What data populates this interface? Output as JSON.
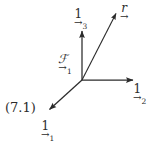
{
  "figure": {
    "kind": "vector-frame-diagram",
    "background_color": "#ffffff",
    "stroke_color": "#2b2b2b",
    "equation_number": "(7.1)",
    "origin": {
      "x": 82,
      "y": 80
    },
    "labels": {
      "unit_vector_1": {
        "symbol": "1",
        "subscript": "1",
        "arrow": "→"
      },
      "unit_vector_2": {
        "symbol": "1",
        "subscript": "2",
        "arrow": "→"
      },
      "unit_vector_3": {
        "symbol": "1",
        "subscript": "3",
        "arrow": "→"
      },
      "position_vector": {
        "symbol": "r",
        "subscript": "",
        "arrow": "→"
      },
      "frame": {
        "symbol": "ℱ",
        "subscript": "1",
        "arrow": "→"
      }
    },
    "vectors": [
      {
        "name": "unit-vector-1",
        "from": [
          82,
          80
        ],
        "to": [
          47,
          112
        ],
        "label": "1",
        "subscript": "1"
      },
      {
        "name": "unit-vector-2",
        "from": [
          82,
          80
        ],
        "to": [
          136,
          80
        ],
        "label": "1",
        "subscript": "2"
      },
      {
        "name": "unit-vector-3",
        "from": [
          82,
          80
        ],
        "to": [
          82,
          28
        ],
        "label": "1",
        "subscript": "3"
      },
      {
        "name": "position-vector-r",
        "from": [
          82,
          80
        ],
        "to": [
          118,
          10
        ],
        "label": "r",
        "subscript": ""
      }
    ]
  }
}
